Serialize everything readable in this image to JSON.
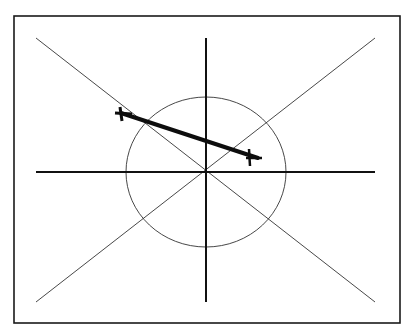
{
  "diagram": {
    "title": "",
    "compass": {
      "north": "N",
      "south": "S",
      "east": "E",
      "west": "W"
    },
    "grid": {
      "units_per_side_x": 12,
      "units_per_side_y": 12,
      "top_labels": [
        "12",
        "11",
        "10",
        "9",
        "8",
        "7",
        "6",
        "5",
        "4",
        "3",
        "2",
        "1",
        "0",
        "1",
        "2",
        "3",
        "4",
        "5",
        "6",
        "7",
        "8",
        "9",
        "10",
        "11",
        "12"
      ],
      "left_labels": [
        "12",
        "11",
        "10",
        "9",
        "8",
        "7",
        "6",
        "5",
        "4",
        "3",
        "2",
        "1",
        "0",
        "1",
        "2",
        "3",
        "4",
        "5",
        "6",
        "7",
        "8",
        "9",
        "10",
        "11",
        "12"
      ]
    },
    "shaded_regions": [
      {
        "name": "northwest-block",
        "x_from": -9,
        "x_to": -1,
        "y_from": 9,
        "y_to": 1
      },
      {
        "name": "center-east-block",
        "x_from": -1,
        "x_to": 7,
        "y_from": 5,
        "y_to": -3
      }
    ],
    "circle": {
      "center": [
        0,
        0
      ],
      "radius_units": 5.6
    },
    "diagonals": [
      "NW-SE",
      "NE-SW"
    ],
    "arrow": {
      "from": [
        -6,
        5.3
      ],
      "to": [
        3.6,
        1.3
      ],
      "description": "heavy vector line from NW block toward E block"
    },
    "colors": {
      "ink": "#1a1a1a",
      "shade": "#c9c9c9",
      "paper": "#ffffff"
    }
  }
}
